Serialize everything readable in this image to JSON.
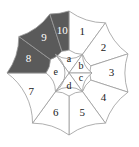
{
  "diagram": {
    "type": "concentric-wheel",
    "geometry": {
      "center_x": 69,
      "center_y": 73,
      "inner_radius": 23,
      "outer_radius": 62
    },
    "colors": {
      "shaded_fill": "#5a5a5a",
      "plain_fill": "#ffffff",
      "stroke": "#9a9a9a",
      "label_dark": "#1b1b1b",
      "label_light": "#ffffff"
    },
    "outer_ring": {
      "sector_count": 10,
      "sectors": [
        {
          "label": "1",
          "shaded": false,
          "start_deg": 54,
          "end_deg": 90
        },
        {
          "label": "2",
          "shaded": false,
          "start_deg": 18,
          "end_deg": 54
        },
        {
          "label": "3",
          "shaded": false,
          "start_deg": -18,
          "end_deg": 18
        },
        {
          "label": "4",
          "shaded": false,
          "start_deg": -54,
          "end_deg": -18
        },
        {
          "label": "5",
          "shaded": false,
          "start_deg": -90,
          "end_deg": -54
        },
        {
          "label": "6",
          "shaded": false,
          "start_deg": -126,
          "end_deg": -90
        },
        {
          "label": "7",
          "shaded": false,
          "start_deg": -180,
          "end_deg": -126
        },
        {
          "label": "8",
          "shaded": true,
          "start_deg": 144,
          "end_deg": 180
        },
        {
          "label": "9",
          "shaded": true,
          "start_deg": 108,
          "end_deg": 144
        },
        {
          "label": "10",
          "shaded": true,
          "start_deg": 90,
          "end_deg": 108
        }
      ]
    },
    "inner_circle": {
      "sector_count": 5,
      "sectors": [
        {
          "label": "a",
          "shaded": false,
          "start_deg": 54,
          "end_deg": 126
        },
        {
          "label": "b",
          "shaded": false,
          "start_deg": 0,
          "end_deg": 54
        },
        {
          "label": "c",
          "shaded": false,
          "start_deg": -54,
          "end_deg": 0
        },
        {
          "label": "d",
          "shaded": false,
          "start_deg": -126,
          "end_deg": -54
        },
        {
          "label": "e",
          "shaded": false,
          "start_deg": 126,
          "end_deg": 234
        }
      ]
    }
  }
}
